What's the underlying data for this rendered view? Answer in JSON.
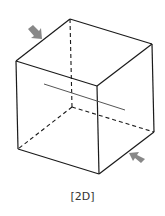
{
  "diagram": {
    "caption": "[2D]",
    "shape": "cube",
    "colors": {
      "edge": "#1a1a1a",
      "arrow": "#888888",
      "plane_line": "#555555",
      "background": "#ffffff"
    },
    "vertices": {
      "top_back": [
        70,
        19
      ],
      "top_right": [
        152,
        44
      ],
      "top_left": [
        16,
        61
      ],
      "top_front": [
        97,
        86
      ],
      "bottom_left": [
        18,
        149
      ],
      "bottom_front": [
        99,
        174
      ],
      "bottom_right": [
        154,
        132
      ],
      "bottom_back_hidden": [
        72,
        107
      ]
    },
    "arrows": [
      {
        "name": "compression-arrow-upper-left",
        "direction": "down-right"
      },
      {
        "name": "compression-arrow-lower-right",
        "direction": "up-left"
      }
    ]
  }
}
